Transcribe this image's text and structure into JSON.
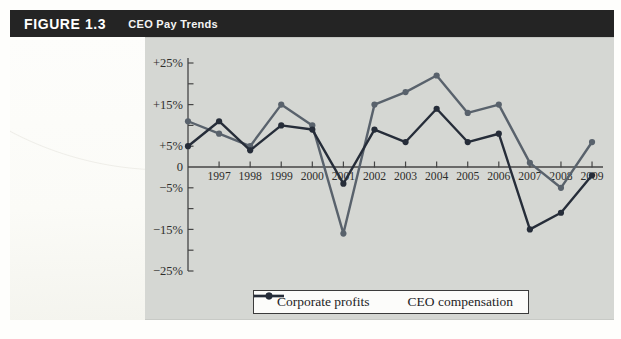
{
  "header": {
    "figure_label": "FIGURE 1.3",
    "title": "CEO Pay Trends"
  },
  "chart_data": {
    "type": "line",
    "x": [
      1996,
      1997,
      1998,
      1999,
      2000,
      2001,
      2002,
      2003,
      2004,
      2005,
      2006,
      2007,
      2008,
      2009
    ],
    "x_axis": {
      "tick_labels": [
        "1997",
        "1998",
        "1999",
        "2000",
        "2001",
        "2002",
        "2003",
        "2004",
        "2005",
        "2006",
        "2007",
        "2008",
        "2009"
      ]
    },
    "y_axis": {
      "min": -25,
      "max": 25,
      "tick_step": 5,
      "unit": "percent",
      "labeled_ticks": [
        {
          "value": 25,
          "label": "+25%"
        },
        {
          "value": 15,
          "label": "+15%"
        },
        {
          "value": 5,
          "label": "+5%"
        },
        {
          "value": 0,
          "label": "0"
        },
        {
          "value": -5,
          "label": "−5%"
        },
        {
          "value": -15,
          "label": "−15%"
        },
        {
          "value": -25,
          "label": "−25%"
        }
      ],
      "unlabeled_ticks": [
        20,
        10,
        -10,
        -20
      ]
    },
    "series": [
      {
        "name": "Corporate profits",
        "color": "#59626c",
        "values": [
          11,
          8,
          5,
          15,
          10,
          -16,
          15,
          18,
          22,
          13,
          15,
          1,
          -5,
          6
        ]
      },
      {
        "name": "CEO compensation",
        "color": "#262d39",
        "values": [
          5,
          11,
          4,
          10,
          9,
          -4,
          9,
          6,
          14,
          6,
          8,
          -15,
          -11,
          -2
        ]
      }
    ],
    "legend_position": "bottom",
    "grid": false
  },
  "colors": {
    "header_bg": "#242424",
    "header_text": "#ffffff",
    "panel_bg": "#d5d7d3",
    "page_bg": "#fefefc",
    "axis": "#454545",
    "tick_label_text": "#2e2e2c",
    "legend_bg": "#fcfcfa",
    "legend_border": "#3b3b3b"
  }
}
